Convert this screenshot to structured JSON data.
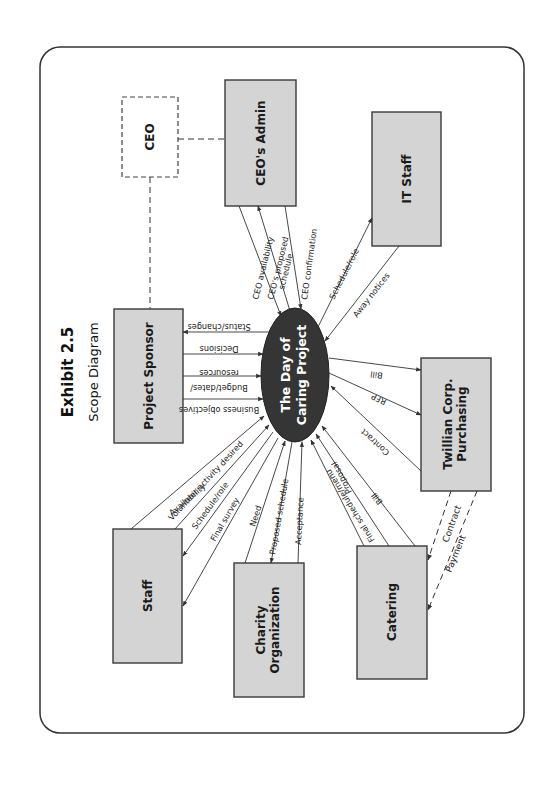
{
  "exhibit": {
    "title": "Exhibit 2.5",
    "subtitle": "Scope Diagram"
  },
  "center": {
    "line1": "The Day of",
    "line2": "Caring Project",
    "fill": "#353535"
  },
  "entities": {
    "ceo": "CEO",
    "ceo_admin": "CEO's Admin",
    "it_staff": "IT Staff",
    "project_sponsor": "Project Sponsor",
    "twillian_line1": "Twillian Corp.",
    "twillian_line2": "Purchasing",
    "staff": "Staff",
    "charity_line1": "Charity",
    "charity_line2": "Organization",
    "catering": "Catering"
  },
  "flows": {
    "ceo_admin": {
      "availability": "CEO availability",
      "proposed_line1": "CEO's proposed",
      "proposed_line2": "schedule",
      "confirmation": "CEO confirmation"
    },
    "it_staff": {
      "schedule_role": "Schedule/role",
      "away_notices": "Away notices"
    },
    "project_sponsor": {
      "status_changes": "Status/changes",
      "decisions": "Decisions",
      "budget_line1": "Budget/dates/",
      "budget_line2": "resources",
      "business_objectives": "Business objectives"
    },
    "twillian": {
      "bill": "Bill",
      "rfp": "RFP",
      "contract": "Contract"
    },
    "staff": {
      "availability": "Availability",
      "volunteer_activity": "Volunteer activity desired",
      "schedule_role": "Schedule/role",
      "final_survey": "Final survey"
    },
    "charity": {
      "need": "Need",
      "proposed_schedule": "Proposed schedule",
      "acceptance": "Acceptance"
    },
    "catering": {
      "proposal": "Proposal",
      "final_schedule_menu": "Final schedule/menu",
      "bill": "Bill"
    },
    "twillian_catering": {
      "contract": "Contract",
      "payment": "Payment"
    }
  },
  "colors": {
    "box_fill": "#d4d4d4",
    "stroke": "#333333",
    "center_fill": "#353535"
  }
}
